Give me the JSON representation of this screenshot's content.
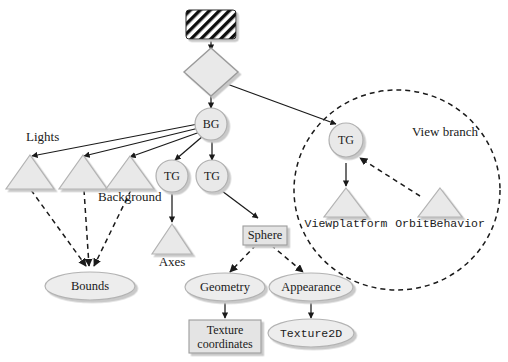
{
  "diagram": {
    "colors": {
      "node_fill": "#e9e9e9",
      "node_stroke": "#9a9a9a",
      "shadow": "#c9c9c9",
      "line": "#1a1a1a",
      "text": "#1a1a1a"
    },
    "nodes": {
      "virtual_universe": {
        "label": "",
        "shape": "hatched-rect"
      },
      "locale": {
        "label": "",
        "shape": "diamond"
      },
      "bg": {
        "label": "BG",
        "shape": "circle"
      },
      "tg_left": {
        "label": "TG",
        "shape": "circle"
      },
      "tg_right": {
        "label": "TG",
        "shape": "circle"
      },
      "tg_view": {
        "label": "TG",
        "shape": "circle"
      },
      "light1": {
        "label": "",
        "shape": "triangle"
      },
      "light2": {
        "label": "",
        "shape": "triangle"
      },
      "background": {
        "label": "",
        "shape": "triangle"
      },
      "axes": {
        "label": "Axes",
        "shape": "triangle"
      },
      "viewplatform": {
        "label": "Viewplatform",
        "shape": "triangle"
      },
      "orbitbehavior": {
        "label": "OrbitBehavior",
        "shape": "triangle"
      },
      "bounds": {
        "label": "Bounds",
        "shape": "ellipse"
      },
      "sphere": {
        "label": "Sphere",
        "shape": "rect"
      },
      "geometry": {
        "label": "Geometry",
        "shape": "ellipse"
      },
      "appearance": {
        "label": "Appearance",
        "shape": "ellipse"
      },
      "texture_coordinates": {
        "label": "Texture\ncoordinates",
        "line1": "Texture",
        "line2": "coordinates",
        "shape": "rect"
      },
      "texture2d": {
        "label": "Texture2D",
        "shape": "ellipse"
      }
    },
    "labels": {
      "lights": "Lights",
      "background": "Background",
      "axes": "Axes",
      "view_branch": "View branch",
      "viewplatform": "Viewplatform",
      "orbitbehavior": "OrbitBehavior",
      "bounds": "Bounds",
      "sphere": "Sphere",
      "geometry": "Geometry",
      "appearance": "Appearance",
      "texture_coordinates_line1": "Texture",
      "texture_coordinates_line2": "coordinates",
      "texture2d": "Texture2D",
      "bg": "BG",
      "tg_left": "TG",
      "tg_right": "TG",
      "tg_view": "TG"
    },
    "edges": [
      {
        "from": "virtual_universe",
        "to": "locale",
        "style": "solid"
      },
      {
        "from": "locale",
        "to": "bg",
        "style": "solid"
      },
      {
        "from": "locale",
        "to": "tg_view",
        "style": "solid"
      },
      {
        "from": "bg",
        "to": "light1",
        "style": "solid"
      },
      {
        "from": "bg",
        "to": "light2",
        "style": "solid"
      },
      {
        "from": "bg",
        "to": "background",
        "style": "solid"
      },
      {
        "from": "bg",
        "to": "tg_left",
        "style": "solid"
      },
      {
        "from": "bg",
        "to": "tg_right",
        "style": "solid"
      },
      {
        "from": "tg_left",
        "to": "axes",
        "style": "solid"
      },
      {
        "from": "tg_right",
        "to": "sphere",
        "style": "solid"
      },
      {
        "from": "light1",
        "to": "bounds",
        "style": "dashed"
      },
      {
        "from": "light2",
        "to": "bounds",
        "style": "dashed"
      },
      {
        "from": "background",
        "to": "bounds",
        "style": "dashed"
      },
      {
        "from": "sphere",
        "to": "geometry",
        "style": "dashed"
      },
      {
        "from": "sphere",
        "to": "appearance",
        "style": "dashed"
      },
      {
        "from": "geometry",
        "to": "texture_coordinates",
        "style": "solid"
      },
      {
        "from": "appearance",
        "to": "texture2d",
        "style": "solid"
      },
      {
        "from": "tg_view",
        "to": "viewplatform",
        "style": "solid"
      },
      {
        "from": "orbitbehavior",
        "to": "tg_view",
        "style": "dashed"
      }
    ]
  }
}
